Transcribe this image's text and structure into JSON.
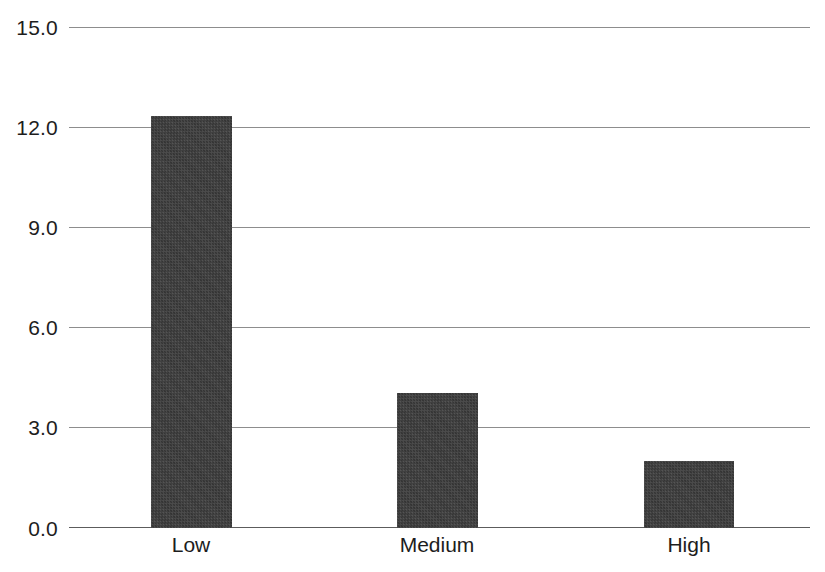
{
  "chart_data": {
    "type": "bar",
    "title": "",
    "subtitle": "",
    "xlabel": "",
    "ylabel": "",
    "categories": [
      "Low",
      "Medium",
      "High"
    ],
    "values": [
      12.35,
      4.05,
      2.0
    ],
    "series": [
      {
        "name": "",
        "values": [
          12.35,
          4.05,
          2.0
        ]
      }
    ],
    "ylim": [
      0.0,
      15.0
    ],
    "ytick_values": [
      0.0,
      3.0,
      6.0,
      9.0,
      12.0,
      15.0
    ],
    "ytick_labels": [
      "0.0",
      "3.0",
      "6.0",
      "9.0",
      "12.0",
      "15.0"
    ],
    "grid": true,
    "grid_axis": "y",
    "legend": false,
    "legend_position": "none",
    "annotations": [],
    "bar_color": "#3b3b3b",
    "grid_color": "#8d8d8d",
    "axis_color": "#5c5c5c",
    "background_color": "#ffffff"
  },
  "axes": {
    "y": {
      "ticks": [
        {
          "label": "15.0",
          "value": 15.0
        },
        {
          "label": "12.0",
          "value": 12.0
        },
        {
          "label": "9.0",
          "value": 9.0
        },
        {
          "label": "6.0",
          "value": 6.0
        },
        {
          "label": "3.0",
          "value": 3.0
        },
        {
          "label": "0.0",
          "value": 0.0
        }
      ]
    },
    "x": {
      "ticks": [
        {
          "label": "Low"
        },
        {
          "label": "Medium"
        },
        {
          "label": "High"
        }
      ]
    }
  }
}
